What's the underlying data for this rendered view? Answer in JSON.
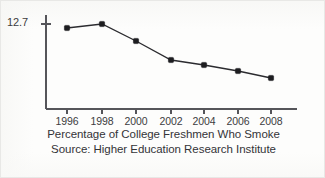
{
  "figure": {
    "background_color": "#fdfdfc",
    "border_color": "#e8e8e6",
    "ink_color": "#2b2b2f"
  },
  "axis": {
    "y_tick_label": "12.7",
    "x_tick_labels": [
      "1996",
      "1998",
      "2000",
      "2002",
      "2004",
      "2006",
      "2008"
    ]
  },
  "captions": {
    "title_line": "Percentage of College Freshmen Who Smoke",
    "source_line": "Source: Higher Education Research Institute"
  },
  "chart_data": {
    "type": "line",
    "title": "Percentage of College Freshmen Who Smoke",
    "subtitle": "Source: Higher Education Research Institute",
    "xlabel": "",
    "ylabel": "",
    "categories": [
      "1996",
      "1998",
      "2000",
      "2002",
      "2004",
      "2006",
      "2008"
    ],
    "x": [
      1996,
      1998,
      2000,
      2002,
      2004,
      2006,
      2008
    ],
    "values": [
      12.5,
      12.7,
      11.8,
      10.6,
      10.3,
      9.9,
      9.5
    ],
    "series": [
      {
        "name": "Percentage of college freshmen who smoke",
        "values": [
          12.5,
          12.7,
          11.8,
          10.6,
          10.3,
          9.9,
          9.5
        ]
      }
    ],
    "y_tick_values": [
      12.7
    ],
    "y_tick_labels": [
      "12.7"
    ],
    "xlim": [
      1995,
      2009.5
    ],
    "ylim": [
      7.6,
      13.1
    ],
    "grid": false,
    "legend": false,
    "marker": "square",
    "marker_color": "#1d1d20",
    "line_color": "#2b2b2f"
  },
  "geometry": {
    "axis_x": 45,
    "axis_top": 14,
    "axis_bottom": 108,
    "axis_right": 296,
    "y_tick_y": 23,
    "point_x": [
      66,
      101,
      135,
      170,
      203,
      237,
      270
    ],
    "point_y": [
      27,
      23,
      40,
      59,
      64,
      70,
      77
    ]
  }
}
